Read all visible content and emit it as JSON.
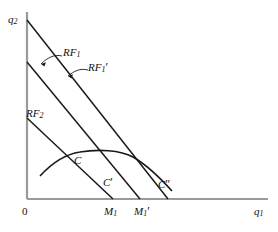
{
  "figure": {
    "kind": "economics-reaction-function-diagram",
    "background_color": "#ffffff",
    "line_color": "#1a1a1a"
  },
  "axes": {
    "y_label": "q",
    "y_label_sub": "2",
    "x_label": "q",
    "x_label_sub": "1",
    "origin_label": "0",
    "x_range_px": [
      27,
      268
    ],
    "y_range_px": [
      12,
      199
    ]
  },
  "curves": {
    "rf1": {
      "label": "RF",
      "label_sub": "1",
      "prime": "",
      "type": "line",
      "from_px": [
        27,
        62
      ],
      "to_px": [
        140,
        199
      ]
    },
    "rf1_prime": {
      "label": "RF",
      "label_sub": "1",
      "prime": "′",
      "type": "line",
      "from_px": [
        27,
        20
      ],
      "to_px": [
        168,
        199
      ]
    },
    "rf2": {
      "label": "RF",
      "label_sub": "2",
      "prime": "",
      "type": "line",
      "from_px": [
        27,
        118
      ],
      "to_px": [
        113,
        199
      ]
    },
    "isoprofit": {
      "type": "concave-curve",
      "left_end_px": [
        40,
        176
      ],
      "peak_px": [
        133,
        152
      ],
      "right_end_px": [
        172,
        190
      ]
    }
  },
  "points": {
    "c": {
      "label": "C",
      "prime": "",
      "at_px": [
        80,
        152
      ]
    },
    "c_p": {
      "label": "C",
      "prime": "′",
      "at_px": [
        112,
        172
      ]
    },
    "c_pp": {
      "label": "C",
      "prime": "″",
      "at_px": [
        168,
        186
      ]
    }
  },
  "ticks": {
    "m1": {
      "label": "M",
      "label_sub": "1",
      "prime": "",
      "at_px": 113
    },
    "m1_prime": {
      "label": "M",
      "label_sub": "1",
      "prime": "′",
      "at_px": 140
    }
  },
  "annotations": {
    "arrow_rf1": {
      "from_px": [
        62,
        57
      ],
      "to_px": [
        38,
        66
      ]
    },
    "arrow_rf1p": {
      "from_px": [
        87,
        71
      ],
      "to_px": [
        66,
        77
      ]
    }
  }
}
